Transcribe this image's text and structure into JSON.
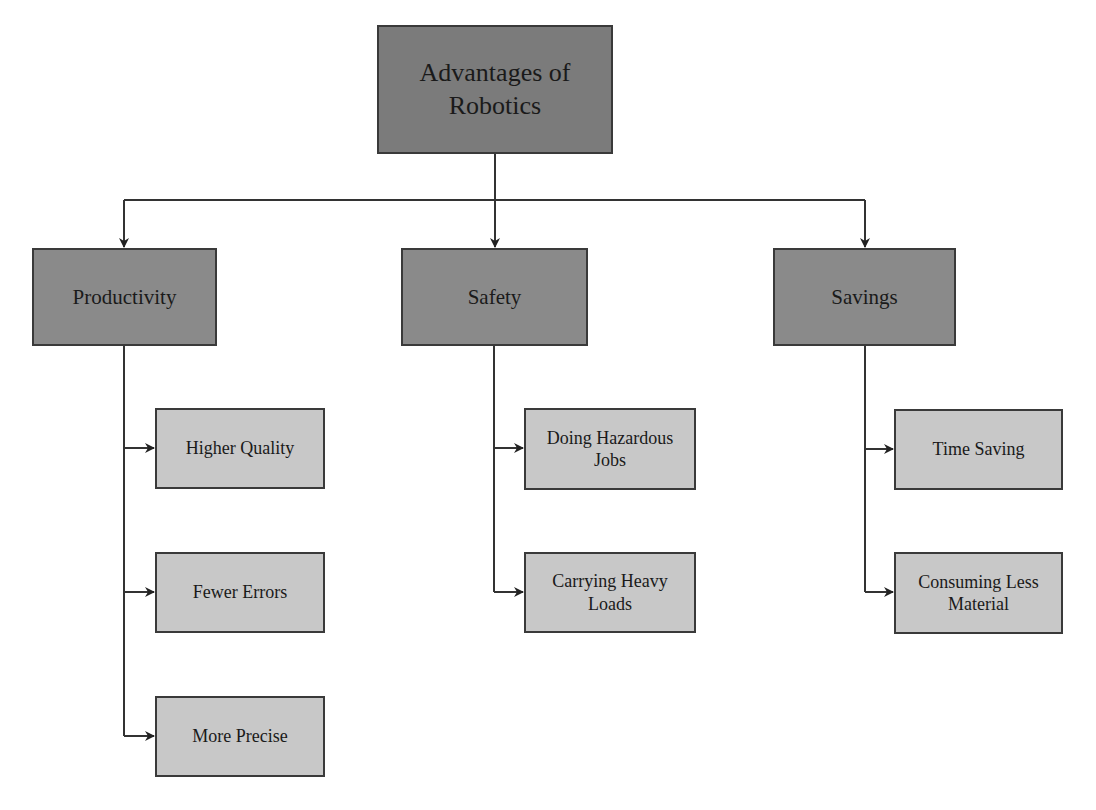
{
  "diagram": {
    "type": "hierarchy",
    "root": {
      "label": "Advantages of Robotics",
      "line1": "Advantages of",
      "line2": "Robotics"
    },
    "categories": [
      {
        "label": "Productivity",
        "children": [
          {
            "label": "Higher Quality"
          },
          {
            "label": "Fewer Errors"
          },
          {
            "label": "More Precise"
          }
        ]
      },
      {
        "label": "Safety",
        "children": [
          {
            "label": "Doing Hazardous Jobs",
            "line1": "Doing Hazardous",
            "line2": "Jobs"
          },
          {
            "label": "Carrying Heavy Loads",
            "line1": "Carrying Heavy",
            "line2": "Loads"
          }
        ]
      },
      {
        "label": "Savings",
        "children": [
          {
            "label": "Time Saving"
          },
          {
            "label": "Consuming Less Material",
            "line1": "Consuming Less",
            "line2": "Material"
          }
        ]
      }
    ],
    "colors": {
      "root_fill": "#7b7b7b",
      "category_fill": "#8a8a8a",
      "leaf_fill": "#c8c8c8",
      "border": "#3a3a3a",
      "connector": "#333333"
    }
  }
}
